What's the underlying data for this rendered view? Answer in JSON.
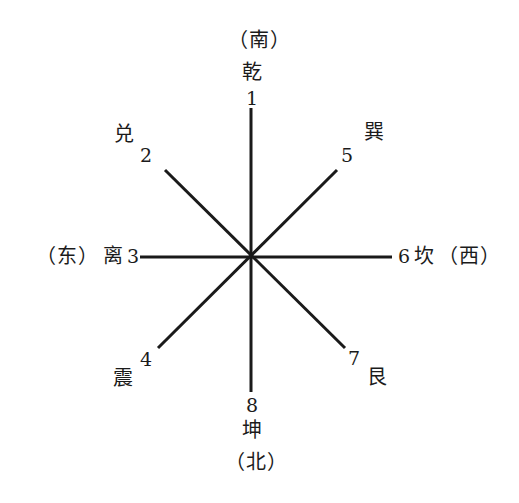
{
  "diagram": {
    "center": {
      "x": 251,
      "y": 257
    },
    "line_color": "#1a1a1a",
    "background": "#ffffff",
    "axes": [
      {
        "name": "vertical",
        "x1": 251,
        "y1": 108,
        "x2": 251,
        "y2": 392
      },
      {
        "name": "horizontal",
        "x1": 140,
        "y1": 257,
        "x2": 392,
        "y2": 257
      },
      {
        "name": "diagonal-nwse",
        "x1": 165,
        "y1": 170,
        "x2": 345,
        "y2": 348
      },
      {
        "name": "diagonal-nesw",
        "x1": 337,
        "y1": 170,
        "x2": 158,
        "y2": 348
      }
    ]
  },
  "labels": {
    "top": {
      "direction": "（南）",
      "trigram": "乾",
      "number": "1"
    },
    "bottom": {
      "number": "8",
      "trigram": "坤",
      "direction": "（北）"
    },
    "left": {
      "direction": "（东）",
      "trigram": "离",
      "number": "3"
    },
    "right": {
      "number": "6",
      "trigram": "坎",
      "direction": "（西）"
    },
    "upper_left": {
      "trigram": "兑",
      "number": "2"
    },
    "upper_right": {
      "number": "5",
      "trigram": "巽"
    },
    "lower_left": {
      "number": "4",
      "trigram": "震"
    },
    "lower_right": {
      "number": "7",
      "trigram": "艮"
    }
  }
}
